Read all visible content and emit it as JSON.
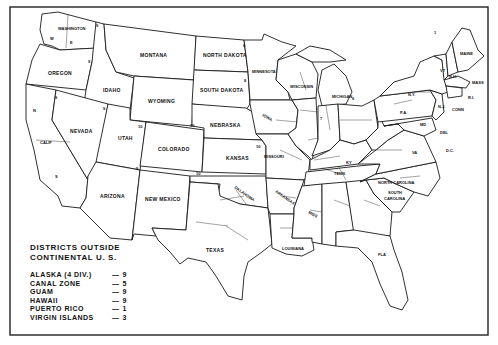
{
  "map": {
    "type": "judicial districts map",
    "country": "United States",
    "states": [
      {
        "name": "WASHINGTON",
        "label": "WASHINGTON",
        "districts": [
          "W",
          "E"
        ]
      },
      {
        "name": "OREGON",
        "label": "OREGON",
        "circuit": "9"
      },
      {
        "name": "CALIF",
        "label": "CALIF",
        "districts": [
          "N",
          "S"
        ]
      },
      {
        "name": "IDAHO",
        "label": "IDAHO",
        "circuit": "9"
      },
      {
        "name": "NEVADA",
        "label": "NEVADA",
        "circuit": "9"
      },
      {
        "name": "MONTANA",
        "label": "MONTANA",
        "circuit": "9"
      },
      {
        "name": "WYOMING",
        "label": "WYOMING",
        "circuit": "10"
      },
      {
        "name": "UTAH",
        "label": "UTAH",
        "circuit": "10"
      },
      {
        "name": "ARIZONA",
        "label": "ARIZONA",
        "circuit": "9"
      },
      {
        "name": "COLORADO",
        "label": "COLORADO",
        "circuit": "10"
      },
      {
        "name": "NEW MEXICO",
        "label": "NEW MEXICO",
        "circuit": "10"
      },
      {
        "name": "NORTH DAKOTA",
        "label": "NORTH DAKOTA",
        "circuit": "8"
      },
      {
        "name": "SOUTH DAKOTA",
        "label": "SOUTH DAKOTA",
        "circuit": "8"
      },
      {
        "name": "NEBRASKA",
        "label": "NEBRASKA"
      },
      {
        "name": "KANSAS",
        "label": "KANSAS",
        "circuit": "10"
      },
      {
        "name": "OKLAHOMA",
        "label": "OKLAHOMA",
        "districts": [
          "N",
          "W",
          "E"
        ],
        "circuit": "10"
      },
      {
        "name": "TEXAS",
        "label": "TEXAS",
        "districts": [
          "N",
          "W",
          "E",
          "S"
        ],
        "circuit": "5"
      },
      {
        "name": "MINNESOTA",
        "label": "MINNESOTA",
        "circuit": "8"
      },
      {
        "name": "IOWA",
        "label": "IOWA",
        "districts": [
          "N",
          "S"
        ],
        "circuit": "8"
      },
      {
        "name": "MISSOURI",
        "label": "MISSOURI",
        "districts": [
          "W",
          "E"
        ],
        "circuit": "8"
      },
      {
        "name": "ARKANSAS",
        "label": "ARKANSAS",
        "districts": [
          "W",
          "E"
        ]
      },
      {
        "name": "LOUISIANA",
        "label": "LOUISIANA",
        "districts": [
          "W",
          "E"
        ]
      },
      {
        "name": "WISCONSIN",
        "label": "WISCONSIN",
        "districts": [
          "W",
          "E"
        ],
        "circuit": "7"
      },
      {
        "name": "MICHIGAN",
        "label": "MICHIGAN",
        "districts": [
          "W",
          "E"
        ],
        "circuit": "6"
      },
      {
        "name": "ILLINOIS",
        "label": "",
        "districts": [
          "N",
          "S",
          "E"
        ],
        "circuit": "7"
      },
      {
        "name": "INDIANA",
        "label": "",
        "districts": [
          "N",
          "S"
        ],
        "circuit": "7"
      },
      {
        "name": "OHIO",
        "label": "",
        "districts": [
          "N",
          "S"
        ],
        "circuit": "6"
      },
      {
        "name": "KENTUCKY",
        "label": "KY",
        "districts": [
          "W",
          "E"
        ]
      },
      {
        "name": "TENNESSEE",
        "label": "TENN",
        "districts": [
          "W",
          "M",
          "E"
        ]
      },
      {
        "name": "MISSISSIPPI",
        "label": "MISS",
        "districts": [
          "N",
          "S"
        ]
      },
      {
        "name": "ALABAMA",
        "label": "",
        "districts": [
          "N",
          "M",
          "S"
        ]
      },
      {
        "name": "GEORGIA",
        "label": "",
        "districts": [
          "N",
          "M",
          "S"
        ]
      },
      {
        "name": "FLORIDA",
        "label": "FLA",
        "districts": [
          "N",
          "S"
        ]
      },
      {
        "name": "SOUTH CAROLINA",
        "label": "SOUTH CAROLINA",
        "districts": [
          "W",
          "E"
        ]
      },
      {
        "name": "NORTH CAROLINA",
        "label": "NORTH CAROLINA",
        "districts": [
          "W",
          "M",
          "E"
        ]
      },
      {
        "name": "VIRGINIA",
        "label": "VA",
        "districts": [
          "W",
          "E"
        ]
      },
      {
        "name": "WEST VIRGINIA",
        "label": "",
        "districts": [
          "N",
          "S"
        ]
      },
      {
        "name": "PENNSYLVANIA",
        "label": "PA",
        "districts": [
          "W",
          "M",
          "E"
        ],
        "circuit": "3"
      },
      {
        "name": "NEW YORK",
        "label": "N.Y.",
        "districts": [
          "W",
          "N",
          "E",
          "S"
        ],
        "circuit": "2"
      },
      {
        "name": "VERMONT",
        "label": "VT",
        "circuit": "2"
      },
      {
        "name": "NEW HAMPSHIRE",
        "label": "N.H.",
        "circuit": "1"
      },
      {
        "name": "MAINE",
        "label": "MAINE",
        "circuit": "1"
      },
      {
        "name": "MASSACHUSETTS",
        "label": "MASS",
        "circuit": "1"
      },
      {
        "name": "RHODE ISLAND",
        "label": "R.I.",
        "circuit": "1"
      },
      {
        "name": "CONNECTICUT",
        "label": "CONN",
        "circuit": "2"
      },
      {
        "name": "NEW JERSEY",
        "label": "N.J.",
        "circuit": "3"
      },
      {
        "name": "DELAWARE",
        "label": "DEL",
        "circuit": "3"
      },
      {
        "name": "MARYLAND",
        "label": "MD",
        "circuit": "4"
      },
      {
        "name": "DISTRICT OF COLUMBIA",
        "label": "D.C."
      }
    ]
  },
  "legend": {
    "title_line1": "DISTRICTS OUTSIDE",
    "title_line2": "CONTINENTAL U. S.",
    "rows": [
      {
        "name": "ALASKA (4 DIV.)",
        "dash": "—",
        "value": "9"
      },
      {
        "name": "CANAL ZONE",
        "dash": "—",
        "value": "5"
      },
      {
        "name": "GUAM",
        "dash": "—",
        "value": "9"
      },
      {
        "name": "HAWAII",
        "dash": "—",
        "value": "9"
      },
      {
        "name": "PUERTO RICO",
        "dash": "—",
        "value": "1"
      },
      {
        "name": "VIRGIN ISLANDS",
        "dash": "—",
        "value": "3"
      }
    ]
  },
  "labels": {
    "washington": "WASHINGTON",
    "oregon": "OREGON",
    "calif": "CALIF",
    "idaho": "IDAHO",
    "nevada": "NEVADA",
    "montana": "MONTANA",
    "wyoming": "WYOMING",
    "utah": "UTAH",
    "arizona": "ARIZONA",
    "colorado": "COLORADO",
    "new_mexico": "NEW MEXICO",
    "north_dakota": "NORTH DAKOTA",
    "south_dakota": "SOUTH DAKOTA",
    "nebraska": "NEBRASKA",
    "kansas": "KANSAS",
    "oklahoma": "OKLAHOMA",
    "texas": "TEXAS",
    "minnesota": "MINNESOTA",
    "iowa": "IOWA",
    "missouri": "MISSOURI",
    "arkansas": "ARKANSAS",
    "louisiana": "LOUISIANA",
    "wisconsin": "WISCONSIN",
    "michigan": "MICHIGAN",
    "ky": "KY",
    "tenn": "TENN",
    "miss": "MISS",
    "fla": "FLA",
    "south_carolina_1": "SOUTH",
    "south_carolina_2": "CAROLINA",
    "north_carolina": "NORTH CAROLINA",
    "va": "VA",
    "pa": "P.A.",
    "ny": "N.Y.",
    "vt": "VT",
    "nh": "N.H.",
    "maine": "MAINE",
    "mass": "MASS",
    "ri": "R.I.",
    "conn": "CONN",
    "nj": "N.J.",
    "del": "DEL",
    "md": "MD",
    "dc": "D.C."
  }
}
